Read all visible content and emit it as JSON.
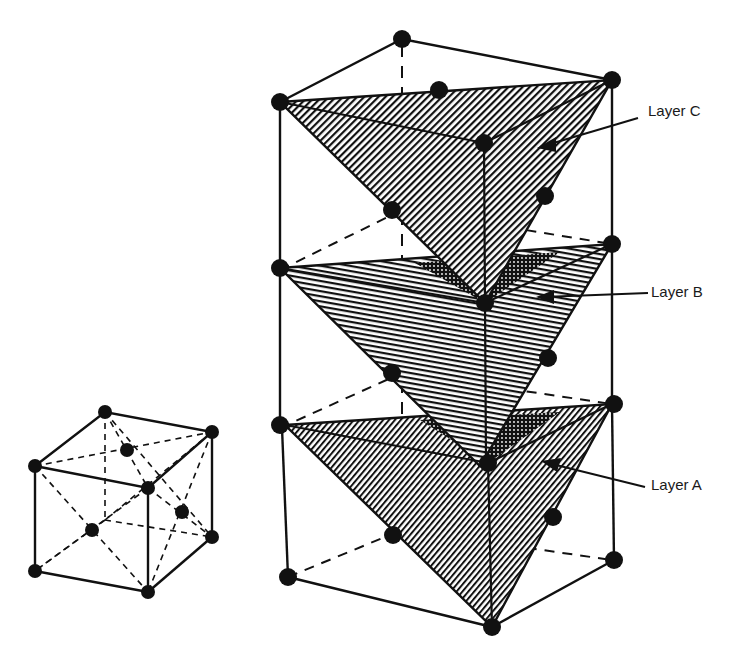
{
  "figure": {
    "colors": {
      "line": "#111111",
      "atom": "#111111",
      "background": "#ffffff"
    }
  },
  "labels": {
    "layer_c": "Layer C",
    "layer_b": "Layer B",
    "layer_a": "Layer A"
  }
}
